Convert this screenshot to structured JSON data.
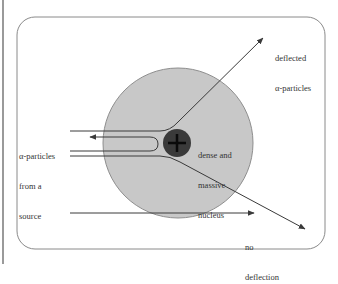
{
  "diagram": {
    "type": "rutherford-scattering",
    "colors": {
      "atom_fill": "#c8c8c8",
      "atom_stroke": "#8e8e8e",
      "nucleus_fill": "#3a3a3a",
      "line": "#3a3a3a",
      "frame": "#8a8a8a"
    },
    "labels": {
      "deflected_line1": "deflected",
      "deflected_line2": "α-particles",
      "source_line1": "α-particles",
      "source_line2": "from a",
      "source_line3": "source",
      "nucleus_line1": "dense and",
      "nucleus_line2": "massive",
      "nucleus_line3": "nucleus",
      "nodeflect_line1": "no",
      "nodeflect_line2": "deflection"
    },
    "nucleus_symbol": "+"
  }
}
